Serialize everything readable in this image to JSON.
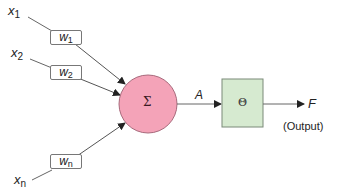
{
  "diagram": {
    "title": "",
    "inputs": [
      {
        "label": "x",
        "subscript": "1",
        "weight": "w",
        "weight_subscript": "1"
      },
      {
        "label": "x",
        "subscript": "2",
        "weight": "w",
        "weight_subscript": "2"
      },
      {
        "label": "x",
        "subscript": "n",
        "weight": "w",
        "weight_subscript": "n"
      }
    ],
    "summation": {
      "symbol": "Σ",
      "fill": "#f4a3b8",
      "stroke": "#a86a7c"
    },
    "activation_label": "A",
    "threshold": {
      "symbol": "Θ",
      "fill": "#d6ead0",
      "stroke": "#7a8a78"
    },
    "output_label": "F",
    "output_caption": "(Output)",
    "colors": {
      "line": "#555555",
      "arrow": "#222222"
    }
  }
}
